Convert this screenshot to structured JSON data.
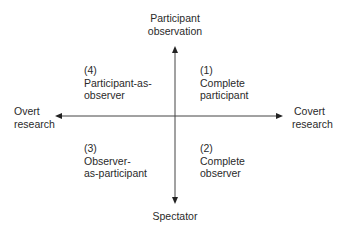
{
  "diagram": {
    "axes": {
      "vertical": {
        "top_label": [
          "Participant",
          "observation"
        ],
        "bottom_label": [
          "Spectator"
        ]
      },
      "horizontal": {
        "left_label": [
          "Overt",
          "research"
        ],
        "right_label": [
          "Covert",
          "research"
        ]
      }
    },
    "quadrants": [
      {
        "position": "top-right",
        "number": "(1)",
        "lines": [
          "Complete",
          "participant"
        ]
      },
      {
        "position": "bottom-right",
        "number": "(2)",
        "lines": [
          "Complete",
          "observer"
        ]
      },
      {
        "position": "bottom-left",
        "number": "(3)",
        "lines": [
          "Observer-",
          "as-participant"
        ]
      },
      {
        "position": "top-left",
        "number": "(4)",
        "lines": [
          "Participant-as-",
          "observer"
        ]
      }
    ],
    "colors": {
      "line": "#333333",
      "text": "#2a2a2a",
      "background": "#ffffff"
    }
  }
}
